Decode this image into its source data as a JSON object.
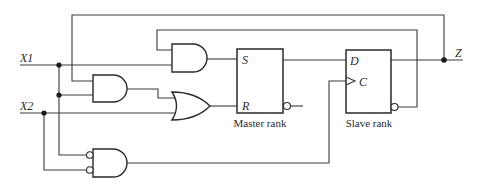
{
  "diagram": {
    "title": "",
    "inputs": [
      {
        "label": "X1"
      },
      {
        "label": "X2"
      }
    ],
    "output": {
      "label": "Z"
    },
    "master": {
      "caption": "Master rank",
      "pins": {
        "s": "S",
        "r": "R"
      }
    },
    "slave": {
      "caption": "Slave rank",
      "pins": {
        "d": "D",
        "c": "C"
      }
    },
    "gates": [
      {
        "id": "and-feedback-x1",
        "type": "AND"
      },
      {
        "id": "and-x1-zbar",
        "type": "AND"
      },
      {
        "id": "or-reset",
        "type": "OR"
      },
      {
        "id": "and-inverted-inputs",
        "type": "AND (inverted inputs)"
      }
    ]
  },
  "colors": {
    "line": "#2a2a2a",
    "background": "#ffffff"
  }
}
